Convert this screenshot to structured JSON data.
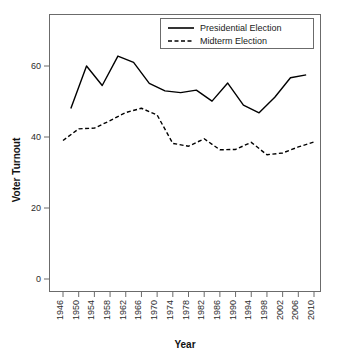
{
  "chart_data": {
    "type": "line",
    "title": "",
    "xlabel": "Year",
    "ylabel": "Voter Turnout",
    "xlim": [
      1946,
      2010
    ],
    "ylim": [
      0,
      68
    ],
    "grid": false,
    "legend_position": "top-right",
    "x_ticks": [
      1946,
      1950,
      1954,
      1958,
      1962,
      1966,
      1970,
      1974,
      1978,
      1982,
      1986,
      1990,
      1994,
      1998,
      2002,
      2006,
      2010
    ],
    "y_ticks": [
      0,
      20,
      40,
      60
    ],
    "series": [
      {
        "name": "Presidential Election",
        "style": "solid",
        "color": "#000000",
        "x": [
          1948,
          1952,
          1956,
          1960,
          1964,
          1968,
          1972,
          1976,
          1980,
          1984,
          1988,
          1992,
          1996,
          2000,
          2004,
          2008
        ],
        "values": [
          48.0,
          60.0,
          54.5,
          62.8,
          61.0,
          55.1,
          53.0,
          52.5,
          53.2,
          50.1,
          55.2,
          49.0,
          46.8,
          51.2,
          56.7,
          57.5
        ]
      },
      {
        "name": "Midterm Election",
        "style": "dashed",
        "color": "#000000",
        "x": [
          1946,
          1950,
          1954,
          1958,
          1962,
          1966,
          1970,
          1974,
          1978,
          1982,
          1986,
          1990,
          1994,
          1998,
          2002,
          2006,
          2010
        ],
        "values": [
          39.0,
          42.3,
          42.5,
          44.6,
          46.9,
          48.1,
          46.2,
          38.2,
          37.4,
          39.5,
          36.4,
          36.5,
          38.5,
          35.0,
          35.5,
          37.2,
          38.6
        ]
      }
    ]
  },
  "legend": {
    "entries": [
      {
        "label": "Presidential Election",
        "style": "solid"
      },
      {
        "label": "Midterm Election",
        "style": "dashed"
      }
    ]
  },
  "axes": {
    "x_title": "Year",
    "y_title": "Voter Turnout"
  }
}
